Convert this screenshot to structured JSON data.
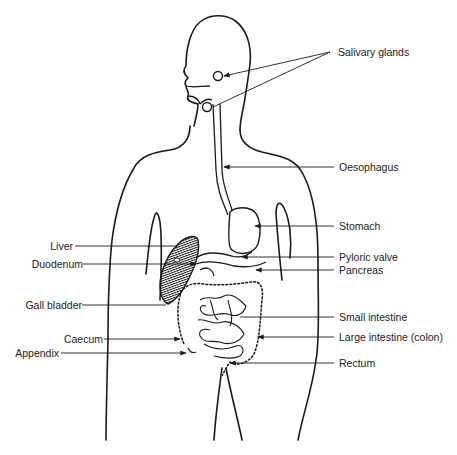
{
  "diagram": {
    "colors": {
      "line": "#1a1a1a",
      "text": "#222222",
      "background": "#ffffff"
    },
    "labels_right": [
      {
        "id": "salivary-glands",
        "text": "Salivary glands",
        "x": 338,
        "y": 49
      },
      {
        "id": "oesophagus",
        "text": "Oesophagus",
        "x": 339,
        "y": 162
      },
      {
        "id": "stomach",
        "text": "Stomach",
        "x": 339,
        "y": 221
      },
      {
        "id": "pyloric-valve",
        "text": "Pyloric valve",
        "x": 339,
        "y": 251
      },
      {
        "id": "pancreas",
        "text": "Pancreas",
        "x": 339,
        "y": 265
      },
      {
        "id": "small-intestine",
        "text": "Small intestine",
        "x": 339,
        "y": 311
      },
      {
        "id": "large-intestine",
        "text": "Large intestine (colon)",
        "x": 339,
        "y": 331
      },
      {
        "id": "rectum",
        "text": "Rectum",
        "x": 339,
        "y": 357
      }
    ],
    "labels_left": [
      {
        "id": "liver",
        "text": "Liver",
        "right": 384,
        "y": 240
      },
      {
        "id": "duodenum",
        "text": "Duodenum",
        "right": 374,
        "y": 258
      },
      {
        "id": "gall-bladder",
        "text": "Gall bladder",
        "right": 375,
        "y": 299
      },
      {
        "id": "caecum",
        "text": "Caecum",
        "right": 354,
        "y": 333
      },
      {
        "id": "appendix",
        "text": "Appendix",
        "right": 398,
        "y": 347
      }
    ]
  }
}
